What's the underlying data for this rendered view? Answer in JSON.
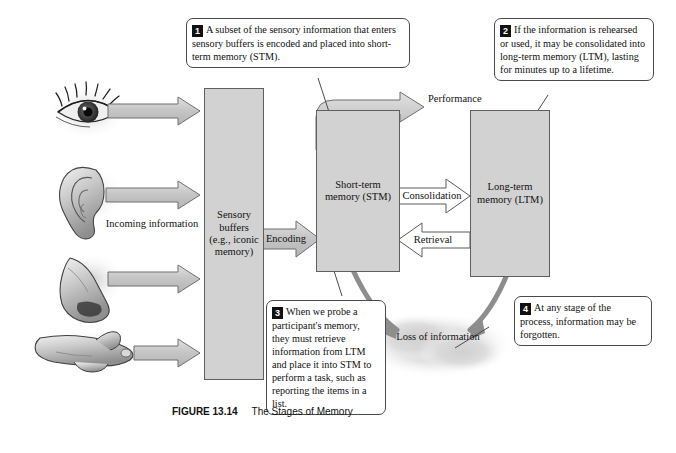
{
  "figure": {
    "caption_label": "FIGURE 13.14",
    "caption_title": "The Stages of Memory"
  },
  "callouts": [
    {
      "number": "1",
      "text": "A subset of the sensory information that enters sensory buffers is encoded and placed into short-term memory (STM)."
    },
    {
      "number": "2",
      "text": "If the information is rehearsed or used, it may be consolidated into long-term memory (LTM), lasting for minutes up to a lifetime."
    },
    {
      "number": "3",
      "text": "When we probe a participant's memory, they must retrieve information from LTM and place it into STM to perform a task, such as reporting the items in a list."
    },
    {
      "number": "4",
      "text": "At any stage of the process, information may be forgotten."
    }
  ],
  "boxes": {
    "sensory_buffers": "Sensory buffers (e.g., iconic memory)",
    "short_term": "Short-term memory (STM)",
    "long_term": "Long-term memory (LTM)"
  },
  "labels": {
    "incoming_information": "Incoming information",
    "encoding": "Encoding",
    "performance": "Performance",
    "consolidation": "Consolidation",
    "retrieval": "Retrieval",
    "loss_of_information": "Loss of information"
  },
  "senses": [
    {
      "name": "eye-icon",
      "label": "eye"
    },
    {
      "name": "ear-icon",
      "label": "ear"
    },
    {
      "name": "nose-icon",
      "label": "nose"
    },
    {
      "name": "finger-icon",
      "label": "finger"
    }
  ],
  "colors": {
    "box_fill": "#d2d2d2",
    "box_stroke": "#5f5f5f",
    "arrow_fill": "#c9c9c9",
    "arrow_stroke": "#6a6a6a",
    "callout_stroke": "#4a4a4a",
    "marker_bg": "#111111",
    "page_bg": "#ffffff",
    "cloud_fill": "#dadada"
  }
}
